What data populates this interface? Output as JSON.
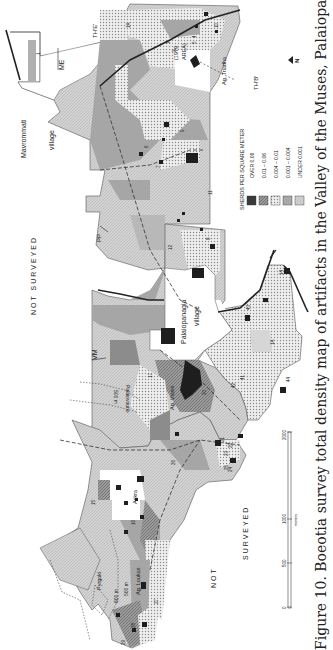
{
  "figure": {
    "caption": "Figure 10. Boeotia survey total density map of artifacts in the Valley of the Muses, Palaiopanagia, and Thespiai",
    "orientation": "rotated 90° (text reads bottom-to-top)"
  },
  "legend": {
    "title": "SHERDS PER SQUARE METER",
    "items": [
      {
        "label": "OVER 0.06",
        "color": "#3a3a3a",
        "pattern": "solid-dark"
      },
      {
        "label": "0.01 – 0.06",
        "color": "#7a7a7a",
        "pattern": "hatched"
      },
      {
        "label": "0.004 – 0.01",
        "color": "#d8d8d8",
        "pattern": "dotted"
      },
      {
        "label": "0.001 – 0.004",
        "color": "#a8a8a8",
        "pattern": "solid-mid"
      },
      {
        "label": "UNDER 0.001",
        "color": "#cfcfcf",
        "pattern": "fine-hatch"
      }
    ]
  },
  "north_arrow": {
    "label": "N"
  },
  "scale_bar": {
    "ticks": [
      "0",
      "500",
      "1000",
      "2000"
    ],
    "unit": "meters"
  },
  "regions": {
    "not_surveyed_top": "NOT  SURVEYED",
    "not_surveyed_bottom_1": "NOT",
    "not_surveyed_bottom_2": "SURVEYED"
  },
  "place_labels": {
    "mavrommati": [
      "Mavrommati",
      "village"
    ],
    "palaiopanagia": [
      "Palaiopanagia",
      "village"
    ],
    "askra": "Askra",
    "ag_triadha": "Ag. Triadha",
    "ag_vlasis": "Ag. Vlasis",
    "ag_loukas": "Ag. Loukas",
    "pyrgaki": "Pyrgaki",
    "palaiovouno": "Palaiovouno",
    "area_1979": [
      "(1979",
      "AREA)"
    ]
  },
  "transect_labels": [
    "ME",
    "TH'E'",
    "TH'B'",
    "PP",
    "VM"
  ],
  "contours": [
    "500 m",
    "600 m",
    "500 m"
  ],
  "site_numbers": [
    "1",
    "2",
    "3",
    "4",
    "5",
    "6",
    "7",
    "8",
    "9",
    "10",
    "11",
    "12",
    "13",
    "14",
    "15",
    "16",
    "17",
    "20",
    "21",
    "22",
    "23",
    "24",
    "25",
    "26",
    "27",
    "28",
    "29",
    "40",
    "41",
    "42",
    "43",
    "44",
    "1A"
  ]
}
